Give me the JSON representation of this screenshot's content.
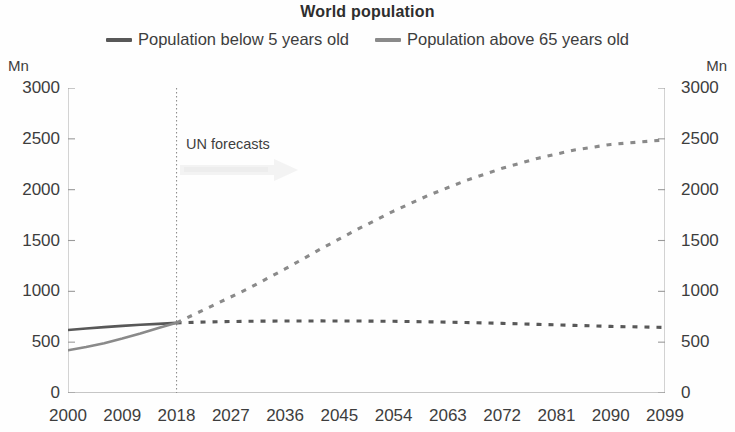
{
  "chart_data": {
    "type": "line",
    "title": "World population",
    "xlabel": "",
    "ylabel": "Mn",
    "y_unit_left": "Mn",
    "y_unit_right": "Mn",
    "ylim": [
      0,
      3000
    ],
    "yticks": [
      3000,
      2500,
      2000,
      1500,
      1000,
      500,
      0
    ],
    "yticks_right": [
      3000,
      2500,
      2000,
      1500,
      1000,
      500,
      0
    ],
    "xlim": [
      2000,
      2099
    ],
    "xticks": [
      2000,
      2009,
      2018,
      2027,
      2036,
      2045,
      2054,
      2063,
      2072,
      2081,
      2090,
      2099
    ],
    "grid": false,
    "legend_position": "top",
    "annotations": [
      {
        "text": "UN forecasts",
        "x": 2019,
        "y": 2350
      }
    ],
    "forecast_divider_year": 2018,
    "series": [
      {
        "name": "Population below 5 years old",
        "color": "#585858",
        "history": {
          "x": [
            2000,
            2003,
            2006,
            2009,
            2012,
            2015,
            2018
          ],
          "y": [
            620,
            635,
            648,
            660,
            672,
            680,
            690
          ]
        },
        "forecast": {
          "x": [
            2018,
            2024,
            2030,
            2036,
            2042,
            2048,
            2054,
            2060,
            2066,
            2072,
            2078,
            2084,
            2090,
            2099
          ],
          "y": [
            690,
            700,
            706,
            708,
            709,
            708,
            705,
            700,
            693,
            685,
            675,
            665,
            655,
            645
          ]
        }
      },
      {
        "name": "Population above 65 years old",
        "color": "#8a8a8a",
        "history": {
          "x": [
            2000,
            2003,
            2006,
            2009,
            2012,
            2015,
            2018
          ],
          "y": [
            420,
            452,
            490,
            535,
            585,
            640,
            690
          ]
        },
        "forecast": {
          "x": [
            2018,
            2024,
            2030,
            2036,
            2042,
            2048,
            2054,
            2060,
            2066,
            2072,
            2078,
            2084,
            2090,
            2099
          ],
          "y": [
            690,
            860,
            1030,
            1220,
            1420,
            1610,
            1790,
            1950,
            2090,
            2210,
            2310,
            2390,
            2445,
            2490
          ]
        }
      }
    ]
  },
  "chart": {
    "title": "World population",
    "unit_left": "Mn",
    "unit_right": "Mn",
    "annotation": "UN forecasts",
    "legend": [
      {
        "label": "Population below 5 years old",
        "color": "#585858"
      },
      {
        "label": "Population above 65 years old",
        "color": "#8a8a8a"
      }
    ],
    "yticks": [
      "3000",
      "2500",
      "2000",
      "1500",
      "1000",
      "500",
      "0"
    ],
    "yticks_right": [
      "3000",
      "2500",
      "2000",
      "1500",
      "1000",
      "500",
      "0"
    ],
    "xticks": [
      "2000",
      "2009",
      "2018",
      "2027",
      "2036",
      "2045",
      "2054",
      "2063",
      "2072",
      "2081",
      "2090",
      "2099"
    ]
  }
}
